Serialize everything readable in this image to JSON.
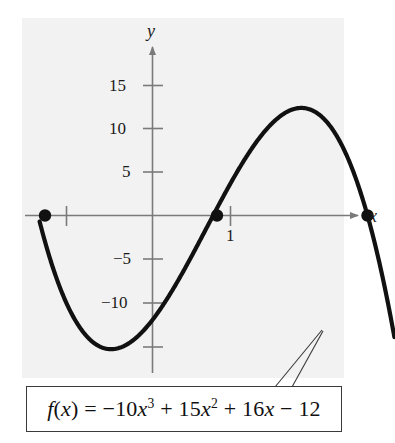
{
  "figure": {
    "background_color": "#ffffff",
    "plot_background_color": "#f2f2f2",
    "curve_color": "#111111",
    "axis_color": "#7a7a7a",
    "box_border_color": "#3a3a3a"
  },
  "axes": {
    "x_label": "x",
    "y_label": "y",
    "x_ticks": [
      {
        "value": 1,
        "label": "1"
      }
    ],
    "y_ticks": [
      {
        "value": 15,
        "label": "15"
      },
      {
        "value": 10,
        "label": "10"
      },
      {
        "value": 5,
        "label": "5"
      },
      {
        "value": -5,
        "label": "−5"
      },
      {
        "value": -10,
        "label": "−10"
      },
      {
        "value": -15,
        "label": ""
      }
    ]
  },
  "formula": {
    "parts": {
      "fx": "f",
      "open": "(",
      "var": "x",
      "close": ")",
      "equals": "=",
      "term1_coef": "−10",
      "term1_var": "x",
      "term1_exp": "3",
      "plus1": "+",
      "term2_coef": "15",
      "term2_var": "x",
      "term2_exp": "2",
      "plus2": "+",
      "term3_coef": "16",
      "term3_var": "x",
      "minus": "−",
      "term4": "12"
    },
    "plain": "f(x) = −10x³ + 15x² + 16x − 12"
  },
  "chart_data": {
    "type": "line",
    "title": "",
    "xlabel": "x",
    "ylabel": "y",
    "grid": false,
    "legend": "none",
    "expression": "f(x) = -10x^3 + 15x^2 + 16x - 12",
    "coefficients": {
      "x3": -10,
      "x2": 15,
      "x1": 16,
      "x0": -12
    },
    "xlim": [
      -1.05,
      2.25
    ],
    "ylim": [
      -17.5,
      19.0
    ],
    "x_ticks": [
      1
    ],
    "y_ticks": [
      -15,
      -10,
      -5,
      5,
      10,
      15
    ],
    "roots": [
      {
        "x": -1.0,
        "y": 0
      },
      {
        "x": 0.6,
        "y": 0
      },
      {
        "x": 2.0,
        "y": 0
      }
    ],
    "marked_points": [
      {
        "x": -1.0,
        "y": 0,
        "style": "filled-dot"
      },
      {
        "x": 0.6,
        "y": 0,
        "style": "filled-dot"
      },
      {
        "x": 2.0,
        "y": 0,
        "style": "filled-dot"
      }
    ],
    "local_extrema": [
      {
        "type": "minimum",
        "x": -0.45,
        "y": -16.0
      },
      {
        "type": "maximum",
        "x": 1.18,
        "y": 12.3
      }
    ],
    "series": [
      {
        "name": "f(x)",
        "x": [
          -1.05,
          -0.95,
          -0.85,
          -0.75,
          -0.65,
          -0.55,
          -0.45,
          -0.35,
          -0.25,
          -0.15,
          -0.05,
          0.05,
          0.15,
          0.25,
          0.35,
          0.45,
          0.55,
          0.65,
          0.75,
          0.85,
          0.95,
          1.05,
          1.15,
          1.25,
          1.35,
          1.45,
          1.55,
          1.65,
          1.75,
          1.85,
          1.95,
          2.05,
          2.15,
          2.25
        ],
        "values": [
          18.1,
          14.8,
          11.8,
          9.1,
          6.7,
          4.6,
          2.8,
          1.3,
          0.1,
          -0.8,
          -1.4,
          -1.6,
          -1.5,
          -1.0,
          -0.2,
          0.9,
          2.4,
          4.2,
          6.3,
          8.7,
          11.3,
          12.0,
          12.3,
          12.2,
          11.7,
          10.6,
          9.0,
          6.7,
          3.8,
          0.1,
          -4.4,
          -9.8,
          -16.1,
          -23.5
        ]
      }
    ]
  }
}
